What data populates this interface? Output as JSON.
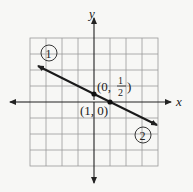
{
  "diagram": {
    "type": "coordinate-graph",
    "axes": {
      "x_label": "x",
      "y_label": "y"
    },
    "grid": {
      "cols": 8,
      "rows": 8,
      "x_range": [
        -4,
        4
      ],
      "y_range": [
        -4,
        4
      ]
    },
    "line": {
      "slope": -0.5,
      "intercept": 0.5,
      "equation_hint": "y = -x/2 + 1/2"
    },
    "points": [
      {
        "label": "(0, 1/2)",
        "label_a": "(0,",
        "label_num": "1",
        "label_den": "2",
        "label_close": ")",
        "x": 0,
        "y": 0.5
      },
      {
        "label": "(1, 0)",
        "x": 1,
        "y": 0
      }
    ],
    "markers": [
      {
        "id": "1",
        "label": "1"
      },
      {
        "id": "2",
        "label": "2"
      }
    ],
    "colors": {
      "grid": "#9a9a9a",
      "axis": "#222222",
      "line": "#1a1a1a",
      "background": "#f7f7f5"
    }
  }
}
